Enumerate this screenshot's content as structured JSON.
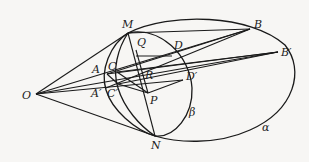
{
  "diagram": {
    "type": "geometry-projection",
    "colors": {
      "background": "#f7f6f4",
      "stroke": "#1a1a1a",
      "text": "#222222"
    },
    "points": {
      "O": {
        "label": "O",
        "x": 36,
        "y": 94
      },
      "M": {
        "label": "M",
        "x": 128,
        "y": 33
      },
      "N": {
        "label": "N",
        "x": 155,
        "y": 136
      },
      "B": {
        "label": "B",
        "x": 250,
        "y": 29
      },
      "B2": {
        "label": "B′",
        "x": 278,
        "y": 52
      },
      "Q": {
        "label": "Q",
        "x": 136,
        "y": 50
      },
      "D": {
        "label": "D",
        "x": 172,
        "y": 56
      },
      "D2": {
        "label": "D′",
        "x": 183,
        "y": 80
      },
      "A": {
        "label": "A",
        "x": 107,
        "y": 74
      },
      "A2": {
        "label": "A′",
        "x": 106,
        "y": 88
      },
      "C": {
        "label": "C",
        "x": 117,
        "y": 72
      },
      "C2": {
        "label": "C′",
        "x": 118,
        "y": 84
      },
      "R": {
        "label": "R",
        "x": 146,
        "y": 77
      },
      "P": {
        "label": "P",
        "x": 148,
        "y": 93
      }
    },
    "curves": {
      "alpha": {
        "label": "α"
      },
      "beta": {
        "label": "β"
      }
    }
  }
}
